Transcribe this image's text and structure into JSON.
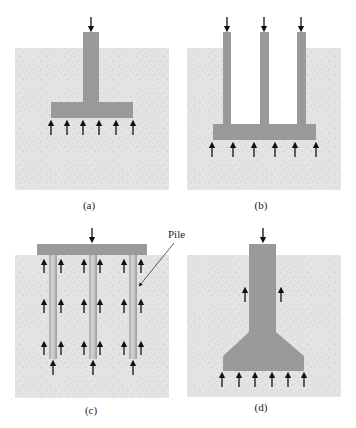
{
  "figure": {
    "colors": {
      "background": "#ffffff",
      "soil": "#e4e4e4",
      "concrete": "#9a9a9a",
      "pile_light": "#c8c8c8",
      "arrow": "#111111"
    },
    "panels": [
      {
        "id": "a",
        "label": "(a)"
      },
      {
        "id": "b",
        "label": "(b)"
      },
      {
        "id": "c",
        "label": "(c)",
        "annotation": "Pile"
      },
      {
        "id": "d",
        "label": "(d)"
      }
    ]
  }
}
